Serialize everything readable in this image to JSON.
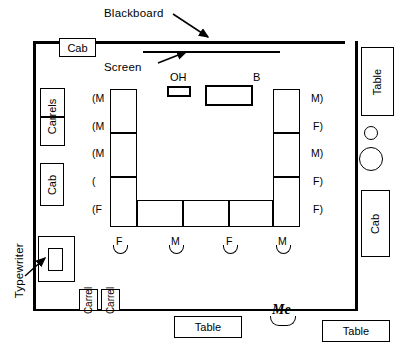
{
  "diagram": {
    "annotations": [
      {
        "name": "blackboard",
        "label": "Blackboard"
      },
      {
        "name": "screen",
        "label": "Screen"
      },
      {
        "name": "typewriter",
        "label": "Typewriter"
      }
    ],
    "equipment": [
      {
        "name": "overhead-projector",
        "label": "OH"
      },
      {
        "name": "bookcase",
        "label": "B"
      }
    ],
    "furniture": [
      {
        "name": "cabinet-top-left",
        "label": "Cab"
      },
      {
        "name": "carrel-left-upper",
        "label": "Carrels"
      },
      {
        "name": "carrel-left-lower",
        "label": ""
      },
      {
        "name": "cabinet-left",
        "label": "Cab"
      },
      {
        "name": "table-top-right",
        "label": "Table"
      },
      {
        "name": "cabinet-right",
        "label": "Cab"
      },
      {
        "name": "carrel-bottom-1",
        "label": "Carrel"
      },
      {
        "name": "carrel-bottom-2",
        "label": "Carrel"
      },
      {
        "name": "table-bottom-center",
        "label": "Table"
      },
      {
        "name": "table-bottom-right",
        "label": "Table"
      }
    ],
    "observer": {
      "name": "me-seat",
      "label": "Me"
    },
    "seating": {
      "left_column": [
        "(M",
        "(M",
        "(M",
        "(",
        "(F"
      ],
      "right_column": [
        "M)",
        "F)",
        "M)",
        "F)",
        "F)"
      ],
      "bottom_row": [
        "F",
        "M",
        "F",
        "M"
      ]
    },
    "colors": {
      "line": "#000000",
      "background": "#ffffff"
    }
  }
}
